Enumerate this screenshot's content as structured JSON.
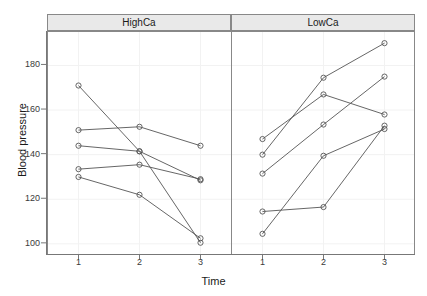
{
  "chart_data": {
    "type": "line",
    "title": "",
    "xlabel": "Time",
    "ylabel": "Blood pressure",
    "xlim": [
      0.5,
      3.5
    ],
    "ylim": [
      95,
      195
    ],
    "x": [
      1,
      2,
      3
    ],
    "xticklabels": [
      "1",
      "2",
      "3"
    ],
    "yticks": [
      100,
      120,
      140,
      160,
      180
    ],
    "yticklabels": [
      "100",
      "120",
      "140",
      "160",
      "180"
    ],
    "grid": true,
    "legend": "none",
    "panel_layout": "1x2 trellis, shared y-axis",
    "panels": [
      {
        "strip_label": "HighCa",
        "series": [
          {
            "name": "subject-1",
            "values": [
              171.0,
              141.5,
              100.5
            ]
          },
          {
            "name": "subject-2",
            "values": [
              151.0,
              152.5,
              144.0
            ]
          },
          {
            "name": "subject-3",
            "values": [
              144.0,
              141.5,
              128.5
            ]
          },
          {
            "name": "subject-4",
            "values": [
              133.5,
              135.5,
              129.0
            ]
          },
          {
            "name": "subject-5",
            "values": [
              130.0,
              122.0,
              102.5
            ]
          }
        ]
      },
      {
        "strip_label": "LowCa",
        "series": [
          {
            "name": "subject-6",
            "values": [
              147.0,
              167.0,
              158.0
            ]
          },
          {
            "name": "subject-7",
            "values": [
              140.0,
              174.5,
              190.0
            ]
          },
          {
            "name": "subject-8",
            "values": [
              131.5,
              153.5,
              175.0
            ]
          },
          {
            "name": "subject-9",
            "values": [
              114.5,
              116.5,
              153.0
            ]
          },
          {
            "name": "subject-10",
            "values": [
              104.5,
              139.5,
              151.5
            ]
          }
        ]
      }
    ],
    "marker": "open-circle",
    "line_color": "#555555",
    "strip_background": "#e9e9e9",
    "grid_color": "#f2f2f2",
    "panel_border_color": "#888888"
  },
  "axes": {
    "ylabel": "Blood pressure",
    "xlabel": "Time"
  }
}
